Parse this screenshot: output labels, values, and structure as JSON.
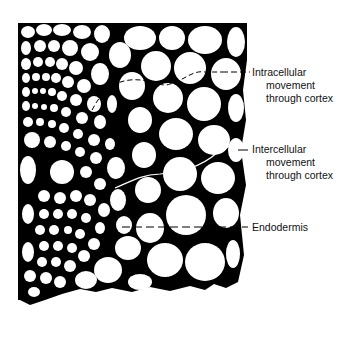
{
  "diagram": {
    "colors": {
      "background": "#ffffff",
      "ink": "#000000",
      "text": "#111111"
    },
    "labels": [
      {
        "id": "intracellular",
        "line1": "Intracellular",
        "line2": "movement",
        "line3": "through cortex"
      },
      {
        "id": "intercellular",
        "line1": "Intercellular",
        "line2": "movement",
        "line3": "through cortex"
      },
      {
        "id": "endodermis",
        "line1": "Endodermis"
      }
    ]
  }
}
